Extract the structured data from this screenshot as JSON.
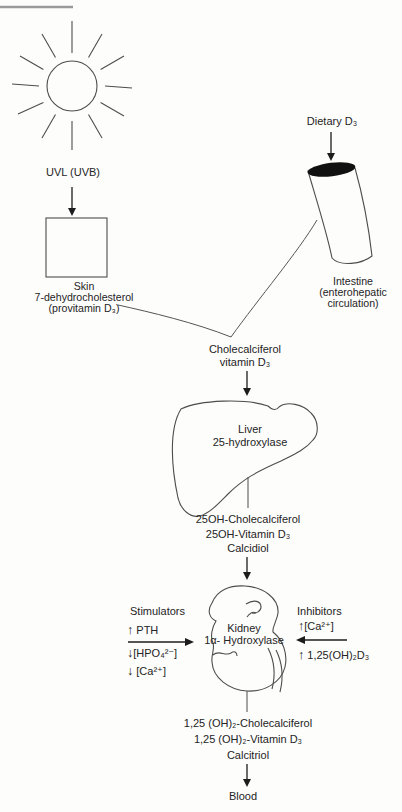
{
  "colors": {
    "ink": "#242424",
    "line": "#4d4d4d",
    "fill_dark": "#101010",
    "page_rule": "#9a9a9a",
    "background": "#fdfdfc"
  },
  "sun": {
    "label": "UVL (UVB)"
  },
  "uv_pathway": {
    "skin_lines": [
      "Skin",
      "7-dehydrocholesterol",
      "(provitamin D₃)"
    ]
  },
  "dietary_pathway": {
    "label": "Dietary D₃",
    "intestine_lines": [
      "Intestine",
      "(enterohepatic",
      "circulation)"
    ]
  },
  "cholecalciferol": {
    "lines": [
      "Cholecalciferol",
      "vitamin D₃"
    ]
  },
  "liver": {
    "lines": [
      "Liver",
      "25-hydroxylase"
    ]
  },
  "calcidiol": {
    "lines": [
      "25OH-Cholecalciferol",
      "25OH-Vitamin D₃",
      "Calcidiol"
    ]
  },
  "kidney": {
    "lines": [
      "Kidney",
      "1α- Hydroxylase"
    ]
  },
  "stimulators": {
    "title": "Stimulators",
    "items": [
      {
        "arrow": "↑",
        "text": " PTH"
      },
      {
        "arrow": "↓",
        "text": "[HPO₄²⁻]"
      },
      {
        "arrow": "↓",
        "text": " [Ca²⁺]"
      }
    ]
  },
  "inhibitors": {
    "title": "Inhibitors",
    "items": [
      {
        "arrow": "↑",
        "text": "[Ca²⁺]"
      },
      {
        "arrow": "↑",
        "text": " 1,25(OH)₂D₃"
      }
    ]
  },
  "calcitriol": {
    "lines": [
      "1,25 (OH)₂-Cholecalciferol",
      "1,25 (OH)₂-Vitamin D₃",
      "Calcitriol"
    ]
  },
  "blood": {
    "label": "Blood"
  }
}
